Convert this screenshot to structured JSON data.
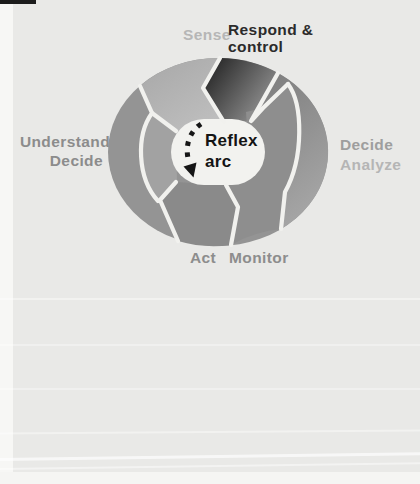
{
  "figure": {
    "center": {
      "line1": "Reflex",
      "line2": "arc"
    },
    "labels": {
      "sense": "Sense",
      "respond_line1": "Respond &",
      "respond_line2": "control",
      "left_line1": "Understand",
      "left_line2": "Decide",
      "right_line1": "Decide",
      "right_line2": "Analyze",
      "bottom_word1": "Act",
      "bottom_word2": "Monitor"
    },
    "colors": {
      "background": "#e9e9e7",
      "page_margin": "#f7f7f5",
      "top_mark": "#1c1c1c",
      "separator": "#f1f1ee",
      "hub": "#f2f2ef",
      "ring_base": "#949494",
      "inner_left": "#a2a2a2",
      "sense_from": "#a7a7a7",
      "sense_to": "#c2c2c2",
      "respond_from": "#242424",
      "respond_to": "#9d9d9d",
      "right_from": "#7e7e7e",
      "right_to": "#a7a7a7",
      "inner_right": "#8e8e8e",
      "bottom_segment": "#8a8a8a",
      "arrow": "#161616",
      "text_sense": "#b6b6b6",
      "text_respond": "#2b2b2b",
      "text_left": "#8c8c8c",
      "text_right1": "#9e9e9e",
      "text_right2": "#b5b5b5",
      "text_bottom": "#8d8d8d",
      "text_center": "#141414"
    }
  }
}
